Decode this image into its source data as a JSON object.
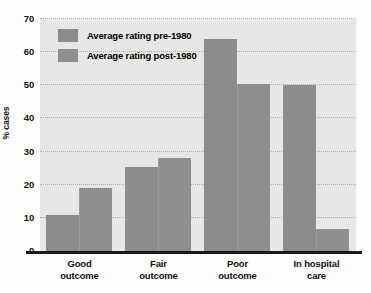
{
  "chart_data": {
    "type": "bar",
    "title": "",
    "xlabel": "",
    "ylabel": "% cases",
    "ylim": [
      0,
      70
    ],
    "yticks": [
      0,
      10,
      20,
      30,
      40,
      50,
      60,
      70
    ],
    "grid": true,
    "legend_position": "top-left",
    "categories": [
      "Good outcome",
      "Fair outcome",
      "Poor outcome",
      "In hospital care"
    ],
    "category_lines": [
      [
        "Good",
        "outcome"
      ],
      [
        "Fair",
        "outcome"
      ],
      [
        "Poor",
        "outcome"
      ],
      [
        "In hospital",
        "care"
      ]
    ],
    "series": [
      {
        "name": "Average rating pre-1980",
        "color": "#8c8c8c",
        "values": [
          11,
          25.5,
          64,
          50
        ]
      },
      {
        "name": "Average rating post-1980",
        "color": "#8f8f8f",
        "values": [
          19,
          28,
          50.5,
          6.5
        ]
      }
    ]
  },
  "colors": {
    "plot_background": "#e7e7e5",
    "page_background": "#fdfdfc",
    "gridline": "#a9a9a6",
    "axis": "#1a1a1a",
    "bar_series_1": "#8c8c8c",
    "bar_series_2": "#8f8f8f",
    "text": "#111111"
  }
}
